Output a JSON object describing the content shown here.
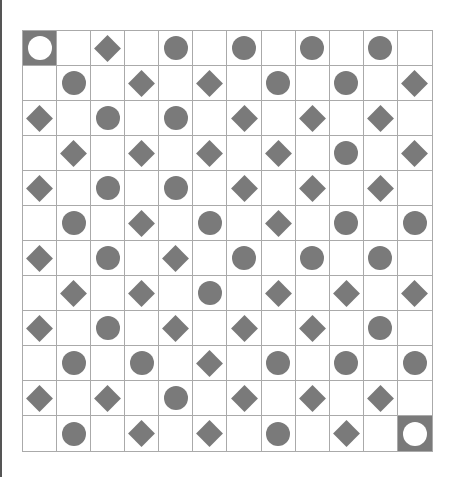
{
  "board": {
    "rows": 12,
    "cols": 12,
    "legend": {
      "S": "terminal",
      "C": "circle",
      "D": "diamond",
      ".": "empty"
    },
    "colors": {
      "piece": "#7a7a7a",
      "grid_line": "#aaaaaa",
      "background": "#ffffff",
      "terminal_bg": "#7a7a7a",
      "terminal_ring": "#ffffff"
    },
    "grid": [
      [
        "S",
        ".",
        "D",
        ".",
        "C",
        ".",
        "C",
        ".",
        "C",
        ".",
        "C",
        "."
      ],
      [
        ".",
        "C",
        ".",
        "D",
        ".",
        "D",
        ".",
        "C",
        ".",
        "C",
        ".",
        "D"
      ],
      [
        "D",
        ".",
        "C",
        ".",
        "C",
        ".",
        "D",
        ".",
        "D",
        ".",
        "D",
        "."
      ],
      [
        ".",
        "D",
        ".",
        "D",
        ".",
        "D",
        ".",
        "D",
        ".",
        "C",
        ".",
        "D"
      ],
      [
        "D",
        ".",
        "C",
        ".",
        "C",
        ".",
        "D",
        ".",
        "D",
        ".",
        "D",
        "."
      ],
      [
        ".",
        "C",
        ".",
        "D",
        ".",
        "C",
        ".",
        "D",
        ".",
        "C",
        ".",
        "C"
      ],
      [
        "D",
        ".",
        "C",
        ".",
        "D",
        ".",
        "C",
        ".",
        "C",
        ".",
        "C",
        "."
      ],
      [
        ".",
        "D",
        ".",
        "D",
        ".",
        "C",
        ".",
        "D",
        ".",
        "D",
        ".",
        "D"
      ],
      [
        "D",
        ".",
        "C",
        ".",
        "D",
        ".",
        "D",
        ".",
        "D",
        ".",
        "C",
        "."
      ],
      [
        ".",
        "C",
        ".",
        "C",
        ".",
        "D",
        ".",
        "C",
        ".",
        "C",
        ".",
        "C"
      ],
      [
        "D",
        ".",
        "D",
        ".",
        "C",
        ".",
        "D",
        ".",
        "D",
        ".",
        "D",
        "."
      ],
      [
        ".",
        "C",
        ".",
        "D",
        ".",
        "D",
        ".",
        "C",
        ".",
        "D",
        ".",
        "S"
      ]
    ]
  }
}
